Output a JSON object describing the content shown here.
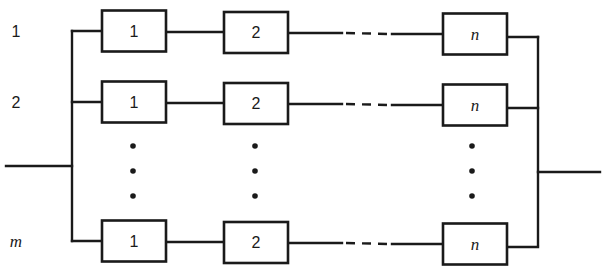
{
  "diagram": {
    "colors": {
      "line": "#1a1a1a",
      "background": "#ffffff"
    },
    "rows": [
      {
        "label": "1",
        "label_italic": false,
        "y": 31,
        "components": [
          "1",
          "2",
          "n"
        ]
      },
      {
        "label": "2",
        "label_italic": false,
        "y": 102,
        "components": [
          "1",
          "2",
          "n"
        ]
      },
      {
        "label": "m",
        "label_italic": true,
        "y": 241,
        "components": [
          "1",
          "2",
          "n"
        ]
      }
    ],
    "component_last_italic": true,
    "ellipsis_rows": "vertical dots between row 2 and row m",
    "input_line": {
      "y": 166
    },
    "output_line": {
      "y": 172
    }
  }
}
